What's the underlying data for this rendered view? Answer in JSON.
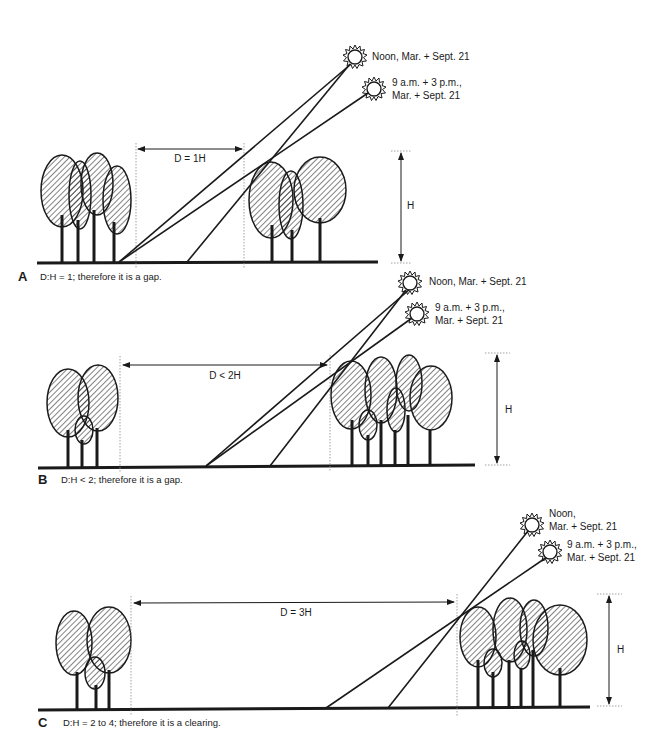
{
  "panels": [
    {
      "letter": "A",
      "caption": "D:H = 1; therefore it is a gap.",
      "distance_label": "D = 1H",
      "height_label": "H",
      "sun_noon_label": [
        "Noon, Mar. + Sept. 21"
      ],
      "sun_morning_label": [
        "9 a.m. + 3 p.m.,",
        "Mar. + Sept. 21"
      ]
    },
    {
      "letter": "B",
      "caption": "D:H < 2; therefore it is a gap.",
      "distance_label": "D < 2H",
      "height_label": "H",
      "sun_noon_label": [
        "Noon, Mar. + Sept. 21"
      ],
      "sun_morning_label": [
        "9 a.m. + 3 p.m.,",
        "Mar. + Sept. 21"
      ]
    },
    {
      "letter": "C",
      "caption": "D:H = 2 to 4; therefore it is a clearing.",
      "distance_label": "D = 3H",
      "height_label": "H",
      "sun_noon_label": [
        "Noon,",
        "Mar. + Sept. 21"
      ],
      "sun_morning_label": [
        "9 a.m. + 3 p.m.,",
        "Mar. + Sept. 21"
      ]
    }
  ],
  "colors": {
    "ink": "#1a1a1a",
    "dotted": "#888888",
    "background": "#ffffff"
  }
}
